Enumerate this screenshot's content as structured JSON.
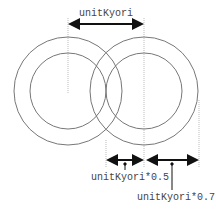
{
  "diagram": {
    "type": "overlapping-concentric-circles",
    "labels": {
      "top_distance": "unitKyori",
      "inner_radius": "unitKyori*0.5",
      "outer_radius": "unitKyori*0.7"
    },
    "colors": {
      "circle_stroke": "#777777",
      "guide_line": "#aaaaaa",
      "arrow": "#111111",
      "text": "#444444",
      "background": "#ffffff"
    }
  }
}
